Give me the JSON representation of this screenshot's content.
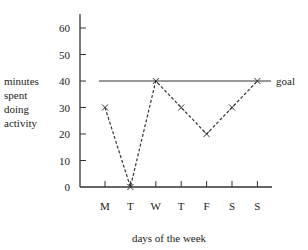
{
  "chart_data": {
    "type": "line",
    "title": "",
    "xlabel": "days of the week",
    "ylabel": "minutes spent doing activity",
    "categories": [
      "M",
      "T",
      "W",
      "T",
      "F",
      "S",
      "S"
    ],
    "series": [
      {
        "name": "minutes",
        "values": [
          30,
          0,
          40,
          30,
          20,
          30,
          40
        ],
        "style": "dashed",
        "marker": "x"
      }
    ],
    "reference_lines": [
      {
        "label": "goal",
        "y": 40,
        "style": "solid"
      }
    ],
    "yticks": [
      0,
      10,
      20,
      30,
      40,
      50,
      60
    ],
    "ylim": [
      0,
      65
    ],
    "grid": false,
    "legend": "none"
  },
  "labels": {
    "ylabel_lines": [
      "minutes",
      "spent",
      "doing",
      "activity"
    ],
    "xlabel": "days of the week",
    "goal": "goal"
  }
}
